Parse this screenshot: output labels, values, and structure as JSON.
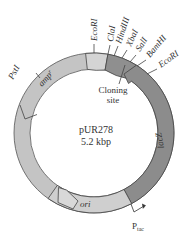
{
  "plasmid": {
    "name": "pUR278",
    "size": "5.2 kbp"
  },
  "genes": {
    "amp": {
      "label": "amp",
      "superscript": "r"
    },
    "lacZ": {
      "label": "lacZ"
    },
    "ori": {
      "label": "ori"
    }
  },
  "sites": {
    "pstI": "PstI",
    "ecoRI_1": "EcoRI",
    "claI": "ClaI",
    "hindIII": "HindIII",
    "xbaI": "XbaI",
    "salI": "SalI",
    "bamHI": "BamHI",
    "ecoRI_2": "EcoRI"
  },
  "cloning_site": {
    "line1": "Cloning",
    "line2": "site"
  },
  "promoter": {
    "label": "P",
    "subscript": "tac"
  },
  "colors": {
    "light_gray": "#c8c8c8",
    "lighter_gray": "#d6d6d6",
    "dark_gray": "#8f8f8f",
    "outline": "#444444"
  }
}
